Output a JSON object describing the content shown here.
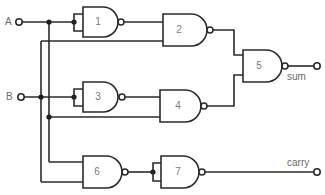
{
  "diagram": {
    "inputs": [
      {
        "label": "A"
      },
      {
        "label": "B"
      }
    ],
    "outputs": [
      {
        "label": "sum"
      },
      {
        "label": "carry"
      }
    ],
    "gates": [
      {
        "number": "1",
        "type": "NAND"
      },
      {
        "number": "2",
        "type": "NAND"
      },
      {
        "number": "3",
        "type": "NAND"
      },
      {
        "number": "4",
        "type": "NAND"
      },
      {
        "number": "5",
        "type": "NAND"
      },
      {
        "number": "6",
        "type": "NAND"
      },
      {
        "number": "7",
        "type": "NAND"
      }
    ],
    "colors": {
      "line": "#2a2a2a",
      "text": "#6a6a6a",
      "background": "#ffffff"
    }
  }
}
